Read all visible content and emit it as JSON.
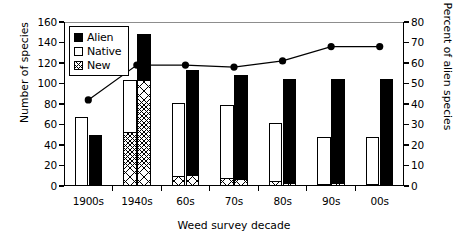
{
  "chart_data": {
    "type": "bar",
    "title": "",
    "subtitle": "",
    "xlabel": "Weed survey decade",
    "ylabel": "Number of species",
    "y2label": "Percent of alien species",
    "categories": [
      "1900s",
      "1940s",
      "60s",
      "70s",
      "80s",
      "90s",
      "00s"
    ],
    "ylim": [
      0,
      160
    ],
    "y2lim": [
      0,
      80
    ],
    "yticks": [
      0,
      20,
      40,
      60,
      80,
      100,
      120,
      140,
      160
    ],
    "y2ticks": [
      0,
      10,
      20,
      30,
      40,
      50,
      60,
      70,
      80
    ],
    "grid": false,
    "legend_position": "top-left",
    "legend": [
      "Alien",
      "Native",
      "New"
    ],
    "series": [
      {
        "name": "Native",
        "kind": "bar",
        "axis": "left",
        "fill": "white",
        "values": [
          67,
          103,
          81,
          79,
          61,
          48,
          48
        ]
      },
      {
        "name": "Alien",
        "kind": "bar",
        "axis": "left",
        "fill": "black",
        "values": [
          50,
          148,
          113,
          108,
          104,
          104,
          104
        ]
      },
      {
        "name": "New (within Native)",
        "kind": "bar-segment",
        "axis": "left",
        "fill": "hatched",
        "values": [
          0,
          53,
          10,
          8,
          5,
          2,
          1.5
        ]
      },
      {
        "name": "New (within Alien)",
        "kind": "bar-segment",
        "axis": "left",
        "fill": "hatched",
        "values": [
          0,
          103,
          10.5,
          7,
          3,
          2.5,
          2
        ]
      },
      {
        "name": "Percent of alien species",
        "kind": "line",
        "axis": "right",
        "marker": "filled-circle",
        "values": [
          42,
          59,
          59,
          58,
          61,
          68,
          68
        ]
      }
    ]
  },
  "legend": {
    "items": [
      {
        "label": "Alien",
        "swatch": "black-square-icon"
      },
      {
        "label": "Native",
        "swatch": "white-square-icon"
      },
      {
        "label": "New",
        "swatch": "hatched-square-icon"
      }
    ]
  },
  "axes": {
    "left": {
      "title": "Number of species",
      "ticks": [
        "0",
        "20",
        "40",
        "60",
        "80",
        "100",
        "120",
        "140",
        "160"
      ]
    },
    "right": {
      "title": "Percent of alien species",
      "ticks": [
        "0",
        "10",
        "20",
        "30",
        "40",
        "50",
        "60",
        "70",
        "80"
      ]
    },
    "bottom": {
      "title": "Weed survey decade",
      "ticks": [
        "1900s",
        "1940s",
        "60s",
        "70s",
        "80s",
        "90s",
        "00s"
      ]
    }
  },
  "colors": {
    "alien": "#000000",
    "native": "#ffffff",
    "outline": "#000000",
    "topline": "#8d8d8d",
    "background": "#ffffff"
  }
}
